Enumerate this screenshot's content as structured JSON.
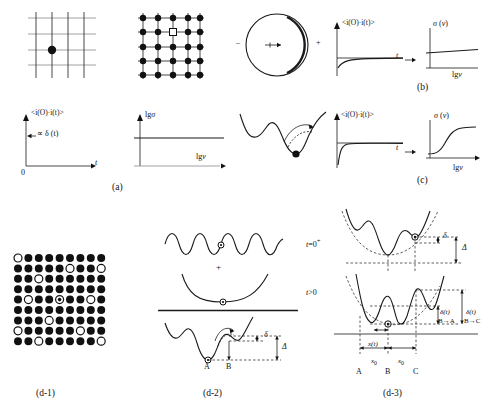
{
  "figure": {
    "title_desc": "Dielectric relaxation mechanisms: lattice, dipole, correlation functions and potential landscapes",
    "captions": {
      "a": "(a)",
      "b": "(b)",
      "c": "(c)",
      "d1": "(d-1)",
      "d2": "(d-2)",
      "d3": "(d-3)"
    }
  },
  "panel_a": {
    "plot_correlation": {
      "ylabel": "<i(O)·i(t)>",
      "xlabel": "t",
      "origin_label": "0",
      "annotation": "∝ δ (t)"
    },
    "plot_sigma": {
      "ylabel": "lgσ",
      "xlabel": "lgν"
    }
  },
  "panel_b": {
    "lattice": {
      "rows": 5,
      "cols": 5,
      "marker": "square-vacancy"
    },
    "dipole": {
      "minus": "–",
      "plus": "+"
    },
    "plot_correlation": {
      "ylabel": "<i(O)·i(t)>",
      "xlabel": "t"
    },
    "plot_sigma": {
      "ylabel": "σ (ν)",
      "xlabel": "lgν"
    }
  },
  "panel_c": {
    "plot_correlation": {
      "ylabel": "<i(O)·i(t)>",
      "xlabel": "t"
    },
    "plot_sigma": {
      "ylabel": "σ (ν)",
      "xlabel": "lgν"
    }
  },
  "panel_d1": {
    "grid": {
      "rows": 9,
      "cols": 9,
      "open_sites": [
        [
          0,
          0
        ],
        [
          1,
          5
        ],
        [
          1,
          8
        ],
        [
          2,
          2
        ],
        [
          4,
          1
        ],
        [
          4,
          7
        ],
        [
          6,
          3
        ],
        [
          7,
          0
        ],
        [
          7,
          6
        ],
        [
          8,
          2
        ],
        [
          8,
          8
        ]
      ],
      "ringed_site": [
        4,
        4
      ]
    }
  },
  "panel_d2": {
    "plus_sign": "+",
    "delta_small": "δ",
    "delta_big": "Δ",
    "site_a": "A",
    "site_b": "B"
  },
  "panel_d3": {
    "time_initial": "t=0⁺",
    "time_later": "t>0",
    "delta_small": "δ",
    "delta_big": "Δ",
    "delta_t_left": "δ(t)",
    "delta_t_right": "δ(t)",
    "transition_left": "B→A",
    "transition_right": "B→C",
    "x_of_t": "x(t)",
    "x0_left": "x₀",
    "x0_right": "x₀",
    "site_a": "A",
    "site_b": "B",
    "site_c": "C"
  },
  "colors": {
    "ink": "#111111",
    "gray": "#8a8a8a",
    "paper": "#ffffff"
  }
}
